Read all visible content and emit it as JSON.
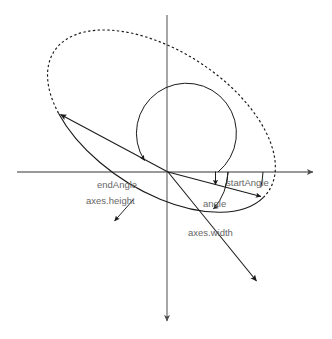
{
  "diagram": {
    "background_color": "#ffffff",
    "axis_color": "#666666",
    "curve_color": "#1a1a1a",
    "label_color": "#666666",
    "labels": {
      "start_angle": "startAngle",
      "end_angle": "endAngle",
      "angle": "angle",
      "axes_width": "axes.width",
      "axes_height": "axes.height"
    },
    "geometry": {
      "origin": {
        "x": 168,
        "y": 172
      },
      "x_axis": {
        "x1": 17,
        "y1": 172,
        "x2": 318,
        "y2": 172
      },
      "y_axis": {
        "x1": 167,
        "y1": 15,
        "x2": 167,
        "y2": 326
      },
      "ellipse": {
        "center_x": 168,
        "center_y": 172,
        "radius_x": 128,
        "radius_y": 70,
        "rotation_deg": 33
      },
      "solid_arc_note": "solid from startAngle point clockwise through bottom-left to endAngle point",
      "dashed_arc_note": "dashed from endAngle point over the top-left back to startAngle point",
      "start_angle_point": {
        "x": 263,
        "y": 197
      },
      "end_angle_point": {
        "x": 58,
        "y": 113
      },
      "axes_width_tip": {
        "x": 258,
        "y": 283
      },
      "axes_height_tip": {
        "x": 58,
        "y": 113
      },
      "start_angle_deg": 20,
      "end_angle_deg": 200,
      "rotation_label_deg": 33
    }
  }
}
